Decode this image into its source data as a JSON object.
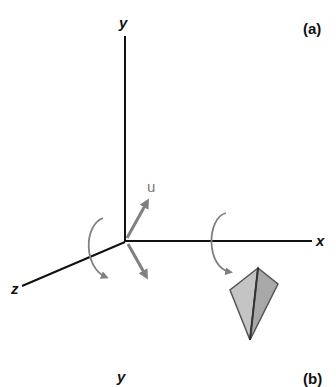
{
  "figure": {
    "panel_a_label": "(a)",
    "panel_b_label": "(b)",
    "axes": {
      "y_label": "y",
      "x_label": "x",
      "z_label": "z"
    },
    "vector_label": "u",
    "colors": {
      "axis": "#111111",
      "arrow": "#808080",
      "kite_left": "#c4c4c4",
      "kite_right": "#a8a8a8",
      "kite_edge": "#555555"
    }
  },
  "panel_b": {
    "y_label": "y"
  }
}
